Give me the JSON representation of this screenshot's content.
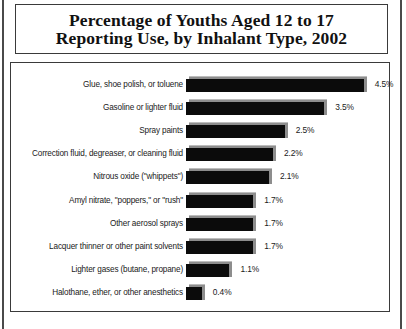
{
  "figure": {
    "title": "Percentage of Youths Aged 12 to 17\nReporting Use, by Inhalant Type, 2002"
  },
  "chart_data": {
    "type": "bar",
    "orientation": "horizontal",
    "title": "Percentage of Youths Aged 12 to 17 Reporting Use, by Inhalant Type, 2002",
    "xlabel": "",
    "ylabel": "",
    "xlim": [
      0,
      4.8
    ],
    "grid": false,
    "legend": null,
    "value_suffix": "%",
    "bar_color": "#0b0b0b",
    "bar_shadow_color": "#8d8d8d",
    "categories": [
      "Glue, shoe polish, or toluene",
      "Gasoline or lighter fluid",
      "Spray paints",
      "Correction fluid, degreaser, or cleaning fluid",
      "Nitrous oxide (\"whippets\")",
      "Amyl nitrate, \"poppers,\" or \"rush\"",
      "Other aerosol sprays",
      "Lacquer thinner or other paint solvents",
      "Lighter gases (butane, propane)",
      "Halothane, ether, or other anesthetics"
    ],
    "values": [
      4.5,
      3.5,
      2.5,
      2.2,
      2.1,
      1.7,
      1.7,
      1.7,
      1.1,
      0.4
    ],
    "value_labels": [
      "4.5%",
      "3.5%",
      "2.5%",
      "2.2%",
      "2.1%",
      "1.7%",
      "1.7%",
      "1.7%",
      "1.1%",
      "0.4%"
    ]
  }
}
